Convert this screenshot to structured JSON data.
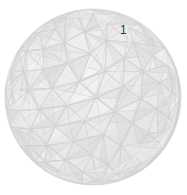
{
  "scene": {
    "object": "geodesic-sphere",
    "label": "1",
    "colors": {
      "background": "#ffffff",
      "base": "#e6e6e6",
      "highlight": "#f7f7f7",
      "shadow": "#cfcfcf",
      "edge": "#d4d4d4",
      "label": "#3a3a3a"
    },
    "geometry": {
      "cx": 93,
      "cy": 97,
      "r": 88
    }
  }
}
